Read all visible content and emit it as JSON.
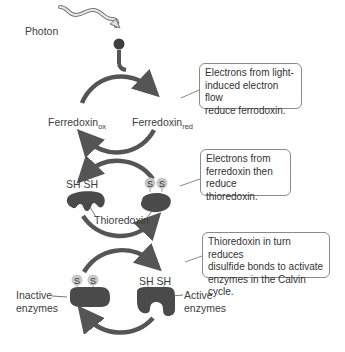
{
  "diagram": {
    "photon_label": "Photon",
    "electron_label": "e⁻",
    "cycle1": {
      "left_label": "Ferredoxin",
      "left_sub": "ox",
      "right_label": "Ferredoxin",
      "right_sub": "red"
    },
    "cycle2": {
      "left_groups": "SH SH",
      "right_groups": [
        "S",
        "S"
      ],
      "protein_label": "Thioredoxin"
    },
    "cycle3": {
      "left_groups": [
        "S",
        "S"
      ],
      "right_groups": "SH SH",
      "left_label": [
        "Inactive",
        "enzymes"
      ],
      "right_label": [
        "Active",
        "enzymes"
      ]
    },
    "callouts": [
      {
        "lines": [
          "Electrons from light-",
          "induced electron flow",
          "reduce ferrodoxin."
        ]
      },
      {
        "lines": [
          "Electrons from",
          "ferredoxin then",
          "reduce thioredoxin."
        ]
      },
      {
        "lines": [
          "Thioredoxin in turn reduces",
          "disulfide bonds to activate",
          "enzymes in the Calvin cycle."
        ]
      }
    ],
    "colors": {
      "arrow": "#555555",
      "protein": "#4a4a4a",
      "sulfur_circle": "#c8c8c8",
      "callout_border": "#8a8a8a"
    }
  }
}
